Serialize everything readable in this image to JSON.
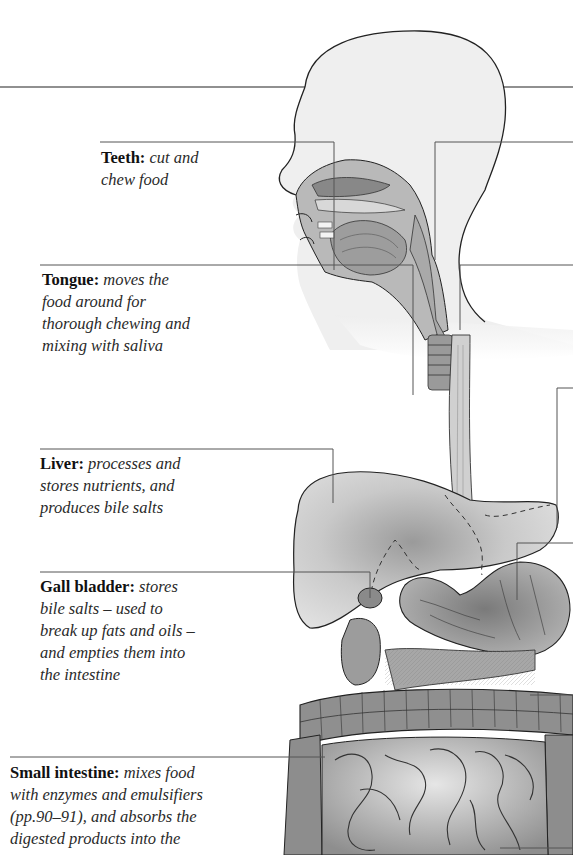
{
  "diagram": {
    "labels": [
      {
        "id": "teeth",
        "term": "Teeth:",
        "description": "cut and chew food",
        "lines": [
          "cut and",
          "chew food"
        ]
      },
      {
        "id": "tongue",
        "term": "Tongue:",
        "description": "moves the food around for thorough chewing and mixing with saliva",
        "lines": [
          "moves the",
          "food around for",
          "thorough chewing and",
          "mixing with saliva"
        ]
      },
      {
        "id": "liver",
        "term": "Liver:",
        "description": "processes and stores nutrients, and produces bile salts",
        "lines": [
          "processes and",
          "stores nutrients, and",
          "produces bile salts"
        ]
      },
      {
        "id": "gall-bladder",
        "term": "Gall bladder:",
        "description": "stores bile salts – used to break up fats and oils – and empties them into the intestine",
        "lines": [
          "stores",
          "bile salts – used to",
          "break up fats and oils –",
          "and empties them into",
          "the intestine"
        ]
      },
      {
        "id": "small-intestine",
        "term": "Small intestine:",
        "description": "mixes food with enzymes and emulsifiers (pp.90–91), and absorbs the digested products into the",
        "lines": [
          "mixes food",
          "with enzymes and emulsifiers",
          "(pp.90–91), and absorbs the",
          "digested products into the"
        ]
      }
    ],
    "organs": [
      "head",
      "nasal cavity",
      "mouth",
      "teeth",
      "tongue",
      "pharynx",
      "trachea",
      "oesophagus",
      "liver",
      "gall bladder",
      "stomach",
      "pancreas",
      "duodenum",
      "large intestine",
      "small intestine"
    ],
    "colors": {
      "background": "#ffffff",
      "outline": "#222222",
      "leader": "#555555",
      "organ_fill": "#d8d8d8",
      "head_fill": "#efefef"
    }
  }
}
